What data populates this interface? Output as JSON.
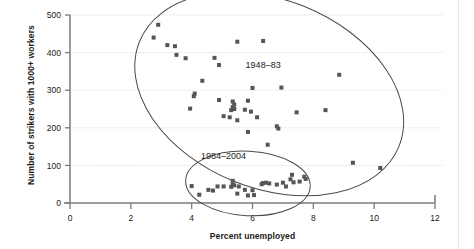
{
  "chart_data": {
    "type": "scatter",
    "title": "",
    "xlabel": "Percent unemployed",
    "ylabel": "Number of strikers with 1000+ workers",
    "xlim": [
      0,
      12
    ],
    "ylim": [
      0,
      500
    ],
    "xticks": [
      0,
      2,
      4,
      6,
      8,
      10,
      12
    ],
    "yticks": [
      0,
      100,
      200,
      300,
      400,
      500
    ],
    "grid": "horizontal-dotted",
    "legend": "none",
    "annotations": [
      {
        "label": "1948–83",
        "x": 6.35,
        "y": 360
      },
      {
        "label": "1984–2004",
        "x": 5.05,
        "y": 118
      }
    ],
    "groups": [
      {
        "name": "1948–83",
        "marker": "square",
        "color": "#555555",
        "points": [
          [
            2.9,
            474
          ],
          [
            2.75,
            440
          ],
          [
            3.2,
            420
          ],
          [
            3.45,
            417
          ],
          [
            3.5,
            394
          ],
          [
            3.8,
            385
          ],
          [
            4.75,
            386
          ],
          [
            4.9,
            367
          ],
          [
            5.5,
            429
          ],
          [
            6.35,
            431
          ],
          [
            8.85,
            341
          ],
          [
            4.35,
            325
          ],
          [
            4.1,
            291
          ],
          [
            4.07,
            284
          ],
          [
            6.0,
            306
          ],
          [
            6.95,
            307
          ],
          [
            3.95,
            251
          ],
          [
            4.9,
            274
          ],
          [
            5.35,
            270
          ],
          [
            5.4,
            262
          ],
          [
            5.85,
            272
          ],
          [
            5.35,
            255
          ],
          [
            5.4,
            250
          ],
          [
            5.3,
            247
          ],
          [
            5.75,
            248
          ],
          [
            5.95,
            243
          ],
          [
            7.45,
            241
          ],
          [
            8.4,
            247
          ],
          [
            5.05,
            231
          ],
          [
            5.25,
            228
          ],
          [
            6.15,
            228
          ],
          [
            5.5,
            220
          ],
          [
            6.8,
            204
          ],
          [
            6.85,
            198
          ],
          [
            5.85,
            189
          ],
          [
            6.5,
            155
          ],
          [
            9.3,
            107
          ],
          [
            10.2,
            93
          ]
        ]
      },
      {
        "name": "1984–2004",
        "marker": "square",
        "color": "#555555",
        "points": [
          [
            4.0,
            45
          ],
          [
            4.25,
            22
          ],
          [
            4.55,
            35
          ],
          [
            4.7,
            33
          ],
          [
            5.05,
            44
          ],
          [
            4.85,
            44
          ],
          [
            5.35,
            59
          ],
          [
            5.35,
            49
          ],
          [
            5.4,
            47
          ],
          [
            5.3,
            43
          ],
          [
            5.55,
            44
          ],
          [
            5.5,
            25
          ],
          [
            5.75,
            35
          ],
          [
            5.85,
            20
          ],
          [
            6.05,
            21
          ],
          [
            6.0,
            34
          ],
          [
            6.35,
            53
          ],
          [
            6.45,
            54
          ],
          [
            6.3,
            50
          ],
          [
            6.8,
            49
          ],
          [
            7.0,
            54
          ],
          [
            7.1,
            44
          ],
          [
            7.25,
            63
          ],
          [
            7.3,
            75
          ],
          [
            7.35,
            55
          ],
          [
            7.55,
            57
          ],
          [
            7.7,
            70
          ],
          [
            7.75,
            64
          ],
          [
            6.55,
            52
          ]
        ]
      }
    ],
    "ellipses": [
      {
        "label": "1948–83",
        "cx": 6.55,
        "cy": 290,
        "rx": 4.6,
        "ry": 1.52,
        "rx_units": "x-units",
        "ry_units": "relative",
        "rotation_deg": 22
      },
      {
        "label": "1984–2004",
        "cx": 5.85,
        "cy": 52,
        "rx": 2.05,
        "ry": 0.52,
        "rx_units": "x-units",
        "ry_units": "relative",
        "rotation_deg": 3
      }
    ]
  },
  "axes": {
    "x_title": "Percent unemployed",
    "y_title": "Number of strikers with 1000+ workers",
    "x_tick_labels": [
      "0",
      "2",
      "4",
      "6",
      "8",
      "10",
      "12"
    ],
    "y_tick_labels": [
      "0",
      "100",
      "200",
      "300",
      "400",
      "500"
    ]
  },
  "style": {
    "marker_color": "#555555",
    "axis_color": "#7a7a7a",
    "grid_color": "#c8c8c8",
    "text_color": "#1a1a1a",
    "background": "#ffffff"
  }
}
